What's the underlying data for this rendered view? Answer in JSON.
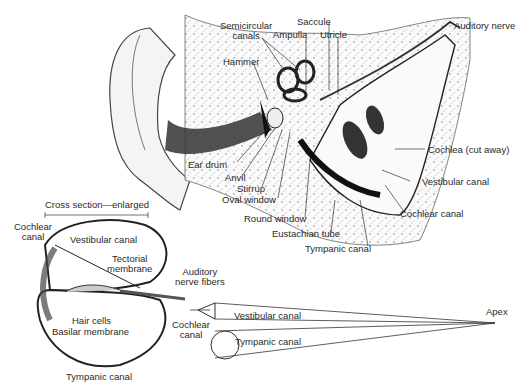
{
  "figure": {
    "ear_labels": {
      "semicircular_canals_1": "Semicircular",
      "semicircular_canals_2": "canals",
      "ampulla": "Ampulla",
      "saccule": "Saccule",
      "utricle": "Utricle",
      "auditory_nerve": "Auditory nerve",
      "hammer": "Hammer",
      "ear_drum": "Ear drum",
      "anvil": "Anvil",
      "stirrup": "Stirrup",
      "oval_window": "Oval window",
      "round_window": "Round window",
      "eustachian_tube": "Eustachian tube",
      "tympanic_canal": "Tympanic canal",
      "cochlea_cut_away": "Cochlea (cut away)",
      "vestibular_canal": "Vestibular canal",
      "cochlear_canal": "Cochlear canal"
    },
    "cross_section": {
      "title": "Cross section—enlarged",
      "cochlear_canal_1": "Cochlear",
      "cochlear_canal_2": "canal",
      "vestibular_canal": "Vestibular canal",
      "tectorial_membrane_1": "Tectorial",
      "tectorial_membrane_2": "membrane",
      "auditory_nerve_fibers_1": "Auditory",
      "auditory_nerve_fibers_2": "nerve fibers",
      "hair_cells": "Hair cells",
      "basilar_membrane": "Basilar membrane",
      "tympanic_canal": "Tympanic canal"
    },
    "uncoiled": {
      "vestibular_canal": "Vestibular canal",
      "cochlear_canal_1": "Cochlear",
      "cochlear_canal_2": "canal",
      "tympanic_canal": "Tympanic canal",
      "apex": "Apex"
    },
    "colors": {
      "ink": "#2a2a2a",
      "shade": "#555555",
      "bone": "#e8e8e8",
      "background": "#ffffff"
    }
  }
}
